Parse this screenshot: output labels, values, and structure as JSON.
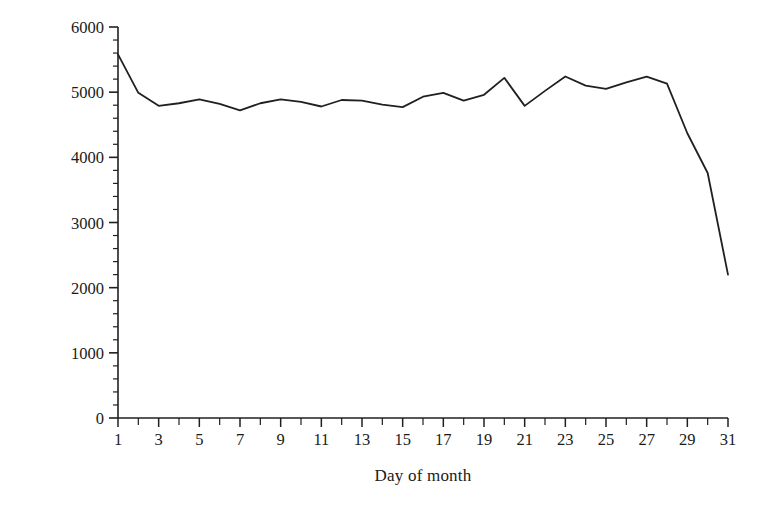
{
  "chart_data": {
    "type": "line",
    "title": "",
    "subtitle": "",
    "xlabel": "Day of month",
    "ylabel": "Crime incidents",
    "x": [
      1,
      2,
      3,
      4,
      5,
      6,
      7,
      8,
      9,
      10,
      11,
      12,
      13,
      14,
      15,
      16,
      17,
      18,
      19,
      20,
      21,
      22,
      23,
      24,
      25,
      26,
      27,
      28,
      29,
      30,
      31
    ],
    "values": [
      5580,
      4990,
      4790,
      4830,
      4890,
      4820,
      4720,
      4830,
      4890,
      4850,
      4780,
      4880,
      4870,
      4810,
      4770,
      4930,
      4990,
      4870,
      4960,
      5220,
      4790,
      5020,
      5240,
      5100,
      5050,
      5150,
      5240,
      5130,
      4370,
      3760,
      2200
    ],
    "series": [
      {
        "name": "Crime incidents",
        "values": [
          5580,
          4990,
          4790,
          4830,
          4890,
          4820,
          4720,
          4830,
          4890,
          4850,
          4780,
          4880,
          4870,
          4810,
          4770,
          4930,
          4990,
          4870,
          4960,
          5220,
          4790,
          5020,
          5240,
          5100,
          5050,
          5150,
          5240,
          5130,
          4370,
          3760,
          2200
        ]
      }
    ],
    "xlim": [
      1,
      31
    ],
    "ylim": [
      0,
      6000
    ],
    "y_ticks": [
      0,
      1000,
      2000,
      3000,
      4000,
      5000,
      6000
    ],
    "y_tick_labels": [
      "0",
      "1000",
      "2000",
      "3000",
      "4000",
      "5000",
      "6000"
    ],
    "y_minor_tick_step": 200,
    "x_ticks": [
      1,
      2,
      3,
      4,
      5,
      6,
      7,
      8,
      9,
      10,
      11,
      12,
      13,
      14,
      15,
      16,
      17,
      18,
      19,
      20,
      21,
      22,
      23,
      24,
      25,
      26,
      27,
      28,
      29,
      30,
      31
    ],
    "x_tick_labels": [
      "1",
      "",
      "3",
      "",
      "5",
      "",
      "7",
      "",
      "9",
      "",
      "11",
      "",
      "13",
      "",
      "15",
      "",
      "17",
      "",
      "19",
      "",
      "21",
      "",
      "23",
      "",
      "25",
      "",
      "27",
      "",
      "29",
      "",
      "31"
    ],
    "x_labeled_ticks": [
      1,
      3,
      5,
      7,
      9,
      11,
      13,
      15,
      17,
      19,
      21,
      23,
      25,
      27,
      29,
      31
    ],
    "grid": false,
    "legend": null,
    "legend_position": "none",
    "line_color": "#231f20",
    "line_width": 1.8,
    "axis_color": "#231f20",
    "background_color": "#ffffff",
    "annotations": []
  }
}
